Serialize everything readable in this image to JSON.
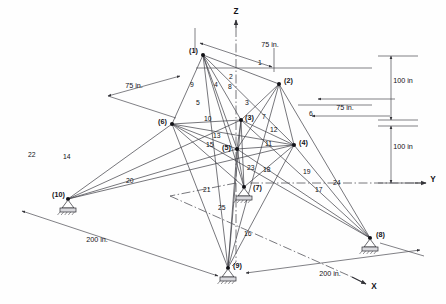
{
  "figure": {
    "units": "in."
  },
  "axes": [
    {
      "id": "z",
      "label": "Z",
      "x": 236,
      "y": 14
    },
    {
      "id": "y",
      "label": "Y",
      "x": 433,
      "y": 182
    },
    {
      "id": "x",
      "label": "X",
      "x": 374,
      "y": 289
    }
  ],
  "nodes": [
    {
      "id": "1",
      "label": "(1)",
      "x": 203,
      "y": 55,
      "lx": 189,
      "ly": 53,
      "support": false
    },
    {
      "id": "2",
      "label": "(2)",
      "x": 279,
      "y": 84,
      "lx": 284,
      "ly": 83,
      "support": false
    },
    {
      "id": "3",
      "label": "(3)",
      "x": 241,
      "y": 120,
      "lx": 245,
      "ly": 120,
      "support": false
    },
    {
      "id": "4",
      "label": "(4)",
      "x": 294,
      "y": 145,
      "lx": 299,
      "ly": 145,
      "support": false
    },
    {
      "id": "5",
      "label": "(5)",
      "x": 237,
      "y": 149,
      "lx": 222,
      "ly": 150,
      "support": false
    },
    {
      "id": "6",
      "label": "(6)",
      "x": 172,
      "y": 124,
      "lx": 158,
      "ly": 124,
      "support": false
    },
    {
      "id": "7",
      "label": "(7)",
      "x": 244,
      "y": 187,
      "lx": 253,
      "ly": 190,
      "support": true
    },
    {
      "id": "8",
      "label": "(8)",
      "x": 370,
      "y": 238,
      "lx": 376,
      "ly": 237,
      "support": true
    },
    {
      "id": "9",
      "label": "(9)",
      "x": 228,
      "y": 268,
      "lx": 233,
      "ly": 268,
      "support": true
    },
    {
      "id": "10",
      "label": "(10)",
      "x": 68,
      "y": 199,
      "lx": 52,
      "ly": 197,
      "support": true
    }
  ],
  "members": [
    {
      "id": "1",
      "from": "1",
      "to": "2",
      "lx": 258,
      "ly": 65
    },
    {
      "id": "2",
      "from": "1",
      "to": "3",
      "lx": 229,
      "ly": 79
    },
    {
      "id": "3",
      "from": "2",
      "to": "3",
      "lx": 245,
      "ly": 105
    },
    {
      "id": "4",
      "from": "1",
      "to": "5",
      "lx": 214,
      "ly": 87
    },
    {
      "id": "5",
      "from": "1",
      "to": "6",
      "lx": 196,
      "ly": 105
    },
    {
      "id": "6",
      "from": "2",
      "to": "4",
      "lx": 309,
      "ly": 116
    },
    {
      "id": "7",
      "from": "2",
      "to": "5",
      "lx": 262,
      "ly": 119
    },
    {
      "id": "8",
      "from": "1",
      "to": "4",
      "lx": 228,
      "ly": 89
    },
    {
      "id": "9",
      "from": "1",
      "to": "6",
      "lx": 190,
      "ly": 87
    },
    {
      "id": "10",
      "from": "6",
      "to": "3",
      "lx": 204,
      "ly": 121
    },
    {
      "id": "11",
      "from": "5",
      "to": "4",
      "lx": 265,
      "ly": 146
    },
    {
      "id": "12",
      "from": "3",
      "to": "4",
      "lx": 270,
      "ly": 132
    },
    {
      "id": "13",
      "from": "6",
      "to": "5",
      "lx": 213,
      "ly": 138
    },
    {
      "id": "14",
      "from": "6",
      "to": "10",
      "lx": 63,
      "ly": 159
    },
    {
      "id": "15",
      "from": "6",
      "to": "5",
      "lx": 206,
      "ly": 147
    },
    {
      "id": "16",
      "from": "5",
      "to": "9",
      "lx": 244,
      "ly": 236
    },
    {
      "id": "17",
      "from": "4",
      "to": "9",
      "lx": 315,
      "ly": 192
    },
    {
      "id": "18",
      "from": "5",
      "to": "7",
      "lx": 263,
      "ly": 172
    },
    {
      "id": "19",
      "from": "4",
      "to": "8",
      "lx": 303,
      "ly": 174
    },
    {
      "id": "20",
      "from": "6",
      "to": "10",
      "lx": 126,
      "ly": 183
    },
    {
      "id": "21",
      "from": "6",
      "to": "9",
      "lx": 203,
      "ly": 192
    },
    {
      "id": "22",
      "from": "5",
      "to": "10",
      "lx": 28,
      "ly": 157
    },
    {
      "id": "23",
      "from": "5",
      "to": "7",
      "lx": 247,
      "ly": 170
    },
    {
      "id": "24",
      "from": "4",
      "to": "8",
      "lx": 333,
      "ly": 185
    },
    {
      "id": "25",
      "from": "5",
      "to": "9",
      "lx": 218,
      "ly": 210
    }
  ],
  "dimensions": [
    {
      "id": "top-right-75",
      "label": "75 in.",
      "lx": 270,
      "ly": 47
    },
    {
      "id": "left-75",
      "label": "75 in.",
      "lx": 134,
      "ly": 88
    },
    {
      "id": "right-75",
      "label": "75 in.",
      "lx": 345,
      "ly": 110
    },
    {
      "id": "upper-100",
      "label": "100 in",
      "lx": 403,
      "ly": 83
    },
    {
      "id": "lower-100",
      "label": "100 in",
      "lx": 403,
      "ly": 149
    },
    {
      "id": "left-200",
      "label": "200 in.",
      "lx": 97,
      "ly": 242
    },
    {
      "id": "bottom-200",
      "label": "200 in.",
      "lx": 330,
      "ly": 276
    }
  ]
}
